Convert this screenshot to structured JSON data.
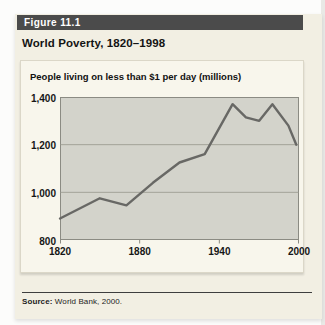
{
  "figure": {
    "label": "Figure 11.1",
    "title": "World Poverty, 1820–1998",
    "source": {
      "prefix": "Source:",
      "text": " World Bank, 2000."
    }
  },
  "chart_data": {
    "type": "line",
    "title": "People living on less than $1 per day (millions)",
    "x": [
      1820,
      1850,
      1870,
      1890,
      1910,
      1929,
      1950,
      1960,
      1970,
      1980,
      1992,
      1998
    ],
    "values": [
      890,
      975,
      945,
      1040,
      1125,
      1160,
      1370,
      1315,
      1300,
      1370,
      1280,
      1200
    ],
    "xlim": [
      1820,
      2000
    ],
    "ylim": [
      800,
      1400
    ],
    "x_ticks": [
      1820,
      1880,
      1940,
      2000
    ],
    "y_ticks": [
      1400,
      1200,
      1000,
      800
    ],
    "grid": true,
    "legend_position": "none",
    "colors": {
      "line": "#686865",
      "plot_bg": "#d3d3cb",
      "grid": "#95958c",
      "frame": "#8b8b83"
    }
  }
}
